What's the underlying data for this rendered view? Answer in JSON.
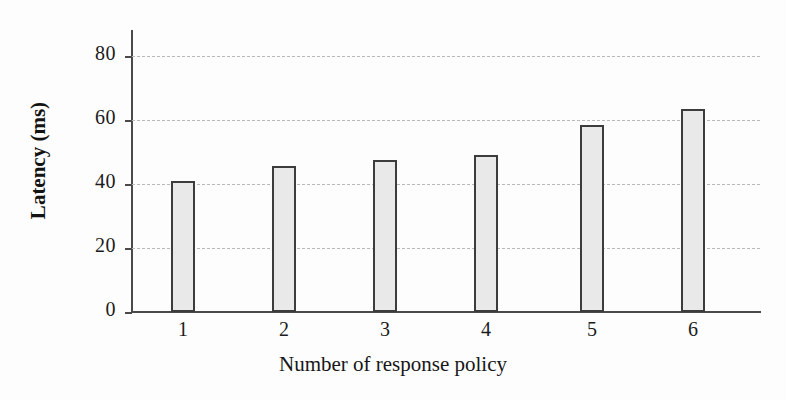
{
  "chart_data": {
    "type": "bar",
    "title": "",
    "xlabel": "Number of response policy",
    "ylabel": "Latency (ms)",
    "categories": [
      "1",
      "2",
      "3",
      "4",
      "5",
      "6"
    ],
    "values": [
      41,
      45.5,
      47.5,
      49,
      58.5,
      63.5
    ],
    "series": [
      {
        "name": "Latency",
        "values": [
          41,
          45.5,
          47.5,
          49,
          58.5,
          63.5
        ]
      }
    ],
    "ylim": [
      0,
      88
    ],
    "yticks": [
      0,
      20,
      40,
      60,
      80
    ],
    "ytick_labels": [
      "0",
      "20",
      "40",
      "60",
      "80"
    ],
    "xtick_labels": [
      "1",
      "2",
      "3",
      "4",
      "5",
      "6"
    ],
    "grid": "horizontal-dashed",
    "legend": "none",
    "bar_fill_color": "#e9e9e9",
    "bar_edge_color": "#3c3c3c",
    "grid_color": "#b9b9b9",
    "axis_color": "#4a4a4a",
    "background_color": "#fdfdfd"
  }
}
